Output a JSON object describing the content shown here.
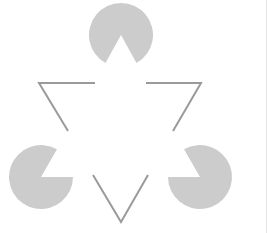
{
  "figure": {
    "name": "Kanizsa triangle illusion",
    "colors": {
      "background": "#ffffff",
      "inducer_fill": "#cccccc",
      "outline_stroke": "#9a9a9a",
      "right_border": "#e4e4e4"
    },
    "inducers": [
      {
        "id": "top",
        "cx": 121,
        "cy": 35,
        "r": 32,
        "notch_direction": "down"
      },
      {
        "id": "bottom-left",
        "cx": 41,
        "cy": 177,
        "r": 32,
        "notch_direction": "up-right"
      },
      {
        "id": "bottom-right",
        "cx": 200,
        "cy": 177,
        "r": 32,
        "notch_direction": "up-left"
      }
    ],
    "outline_triangle_fragments": [
      {
        "id": "top-left-corner",
        "points": "95,83 39,83 68,131"
      },
      {
        "id": "top-right-corner",
        "points": "146,83 201,83 173,131"
      },
      {
        "id": "bottom-corner",
        "points": "93,175 121,222 148,175"
      }
    ]
  }
}
